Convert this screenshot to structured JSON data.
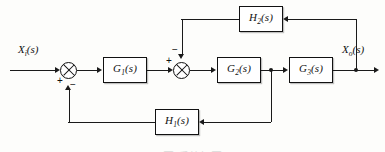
{
  "diagram": {
    "input_signal": {
      "base": "X",
      "sub": "i",
      "arg": "(s)"
    },
    "output_signal": {
      "base": "X",
      "sub": "o",
      "arg": "(s)"
    },
    "forward_blocks": [
      {
        "base": "G",
        "sub": "1",
        "arg": "(s)"
      },
      {
        "base": "G",
        "sub": "2",
        "arg": "(s)"
      },
      {
        "base": "G",
        "sub": "3",
        "arg": "(s)"
      }
    ],
    "feedback_blocks": [
      {
        "base": "H",
        "sub": "2",
        "arg": "(s)",
        "loop": "inner"
      },
      {
        "base": "H",
        "sub": "1",
        "arg": "(s)",
        "loop": "outer"
      }
    ],
    "summing_junctions": [
      {
        "name": "outer-summer",
        "input_sign": "+",
        "feedback_sign": "−"
      },
      {
        "name": "inner-summer",
        "input_sign": "+",
        "feedback_sign": "−"
      }
    ],
    "line_color": "#1a1a1a",
    "block_fill": "#ffffff",
    "caption": "图    系统框图"
  }
}
